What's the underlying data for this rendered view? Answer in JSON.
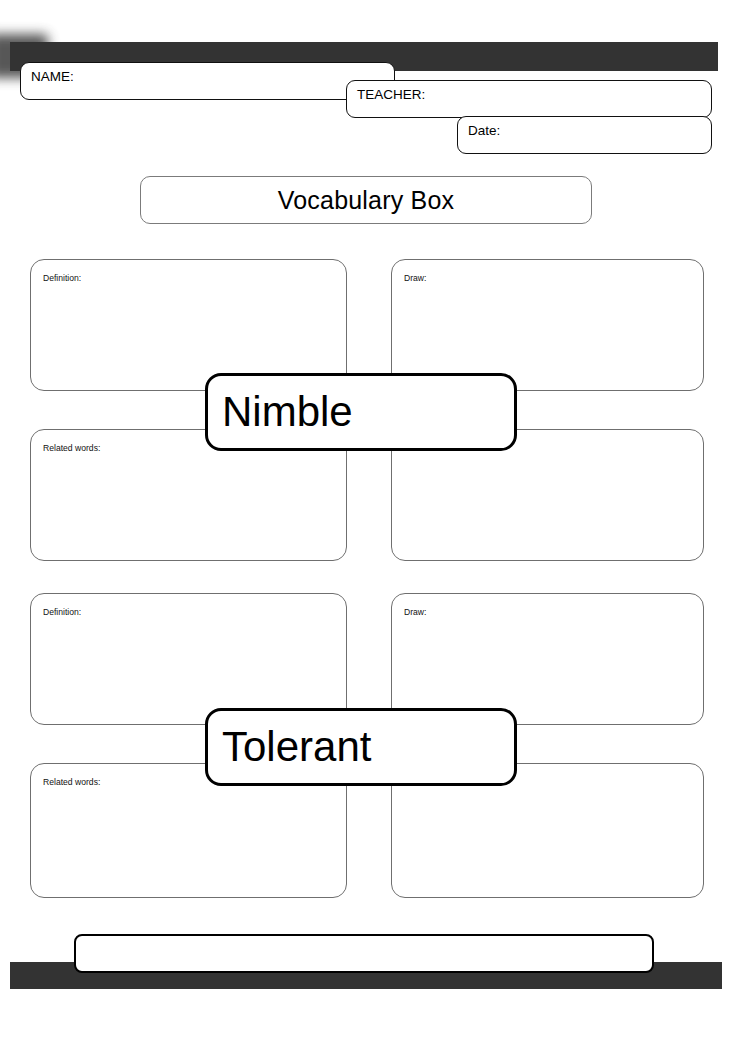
{
  "document": {
    "title": "Vocabulary Box"
  },
  "header": {
    "fields": [
      {
        "key": "name",
        "label": "NAME:",
        "value": "",
        "placeholder": ""
      },
      {
        "key": "teacher",
        "label": "TEACHER:",
        "value": "",
        "placeholder": ""
      },
      {
        "key": "date",
        "label": "Date:",
        "value": "",
        "placeholder": ""
      }
    ]
  },
  "cards": [
    {
      "word": "Nimble",
      "quadrants": [
        {
          "key": "definition",
          "label": "Definition:",
          "value": ""
        },
        {
          "key": "draw",
          "label": "Draw:",
          "value": ""
        },
        {
          "key": "related",
          "label": "Related words:",
          "value": ""
        },
        {
          "key": "sentence",
          "label": "Use in a sentence:",
          "value": ""
        }
      ]
    },
    {
      "word": "Tolerant",
      "quadrants": [
        {
          "key": "definition",
          "label": "Definition:",
          "value": ""
        },
        {
          "key": "draw",
          "label": "Draw:",
          "value": ""
        },
        {
          "key": "related",
          "label": "Related words:",
          "value": ""
        },
        {
          "key": "sentence",
          "label": "Use in a sentence:",
          "value": ""
        }
      ]
    }
  ],
  "footer": {
    "note_box_value": ""
  },
  "colors": {
    "bar": "#333333",
    "outline_strong": "#000000",
    "outline_light": "#6f6f6f",
    "page": "#ffffff"
  }
}
